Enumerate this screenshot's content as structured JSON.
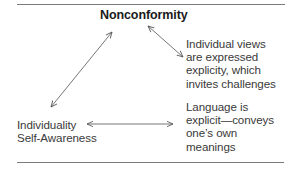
{
  "diagram": {
    "title": "Nonconformity",
    "nodes": {
      "individual_views": {
        "lines": [
          "Individual views",
          "are expressed",
          "explicity, which",
          "invites challenges"
        ]
      },
      "language": {
        "lines": [
          "Language is",
          "explicit—conveys",
          "one’s own",
          "meanings"
        ]
      },
      "individuality": {
        "lines": [
          "Individuality",
          "Self-Awareness"
        ]
      }
    },
    "connections": [
      {
        "from": "Nonconformity",
        "to": "Individuality Self-Awareness",
        "type": "double-arrow"
      },
      {
        "from": "Nonconformity",
        "to": "Individual views are expressed explicity, which invites challenges",
        "type": "double-arrow"
      },
      {
        "from": "Individuality Self-Awareness",
        "to": "Language is explicit—conveys one’s own meanings",
        "type": "double-arrow"
      }
    ],
    "colors": {
      "text": "#3a3a3a",
      "title": "#1a1a1a",
      "rule": "#7a7a7a",
      "arrow": "#555555"
    }
  }
}
